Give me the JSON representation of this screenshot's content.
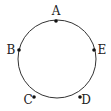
{
  "diagram": {
    "type": "circle-with-points",
    "circle": {
      "cx": 57,
      "cy": 59,
      "r": 39,
      "stroke": "#333333"
    },
    "points": [
      {
        "label": "A",
        "x": 56,
        "y": 21,
        "lx": 56,
        "ly": 15
      },
      {
        "label": "B",
        "x": 19,
        "y": 50,
        "lx": 11,
        "ly": 54
      },
      {
        "label": "C",
        "x": 34,
        "y": 97,
        "lx": 27,
        "ly": 104
      },
      {
        "label": "D",
        "x": 80,
        "y": 97,
        "lx": 86,
        "ly": 104
      },
      {
        "label": "E",
        "x": 94,
        "y": 50,
        "lx": 102,
        "ly": 54
      }
    ]
  }
}
